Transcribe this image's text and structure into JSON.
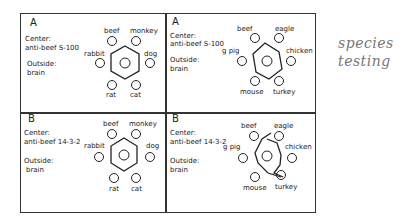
{
  "panels": [
    {
      "letter": "A",
      "center_label": "Center:",
      "center_value": "anti-beef S-100",
      "outside_label": "Outside:",
      "outside_value": "brain",
      "wells": [
        "beef",
        "monkey",
        "rabbit",
        "dog",
        "rat",
        "cat"
      ]
    },
    {
      "letter": "A",
      "center_label": "Center:",
      "center_value": "anti-beef S-100",
      "outside_label": "Outside:",
      "outside_value": "brain",
      "wells": [
        "beef",
        "eagle",
        "g pig",
        "chicken",
        "mouse",
        "turkey"
      ]
    },
    {
      "letter": "B",
      "center_label": "Center:",
      "center_value": "anti-beef 14-3-2",
      "outside_label": "Outside:",
      "outside_value": "brain",
      "wells": [
        "beef",
        "monkey",
        "rabbit",
        "dog",
        "rat",
        "cat"
      ]
    },
    {
      "letter": "B",
      "center_label": "Center:",
      "center_value": "anti-beef 14-3-2",
      "outside_label": "Outside:",
      "outside_value": "brain",
      "wells": [
        "beef",
        "eagle",
        "g pig",
        "chicken",
        "mouse",
        "turkey"
      ]
    }
  ],
  "annotation": {
    "line1": "species",
    "line2": "testing"
  }
}
